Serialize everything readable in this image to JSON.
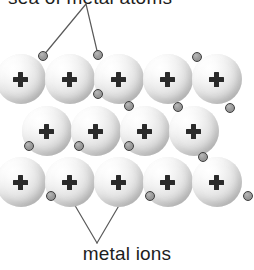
{
  "figure": {
    "background_color": "#ffffff"
  },
  "labels": {
    "top": {
      "text": "sea of metal atoms",
      "visible_fragment": "s of metal atoms",
      "clipped": "true",
      "font_size_px": 19,
      "color": "#1d1d1d"
    },
    "bottom": {
      "text": "metal ions",
      "font_size_px": 19,
      "color": "#1d1d1d"
    }
  },
  "colors": {
    "ion_highlight": "#ffffff",
    "ion_midtone": "#e4e4e4",
    "ion_shadow": "#a9a9a9",
    "electron_fill": "#9d9d9d",
    "electron_stroke": "#3c3c3c",
    "plus_sign": "#2a2a2a",
    "leader_line": "#5a5a5a"
  },
  "lattice": {
    "ion_symbol": "+",
    "ion_count": 14,
    "electron_count": 14,
    "rows": [
      {
        "name": "top-row",
        "ion_count": 5,
        "y": 54,
        "diameter": 50,
        "x_positions": [
          -4,
          45,
          94,
          143,
          192
        ]
      },
      {
        "name": "middle-row",
        "ion_count": 4,
        "y": 106,
        "diameter": 50,
        "x_positions": [
          22,
          71,
          120,
          169
        ]
      },
      {
        "name": "bottom-row",
        "ion_count": 5,
        "y": 157,
        "diameter": 50,
        "x_positions": [
          -4,
          45,
          94,
          143,
          192
        ]
      }
    ],
    "electrons": [
      {
        "x": 38,
        "y": 51
      },
      {
        "x": 93,
        "y": 50
      },
      {
        "x": 93,
        "y": 89
      },
      {
        "x": 192,
        "y": 52
      },
      {
        "x": 124,
        "y": 101
      },
      {
        "x": 173,
        "y": 102
      },
      {
        "x": 225,
        "y": 103
      },
      {
        "x": 24,
        "y": 141
      },
      {
        "x": 74,
        "y": 141
      },
      {
        "x": 124,
        "y": 141
      },
      {
        "x": 198,
        "y": 152
      },
      {
        "x": 46,
        "y": 191
      },
      {
        "x": 145,
        "y": 191
      },
      {
        "x": 243,
        "y": 191
      }
    ],
    "leaders": {
      "top": {
        "apex": {
          "x": 86,
          "y": 4
        },
        "targets": [
          {
            "x": 43,
            "y": 56
          },
          {
            "x": 98,
            "y": 55
          }
        ]
      },
      "bottom": {
        "apex": {
          "x": 97,
          "y": 243
        },
        "targets": [
          {
            "x": 70,
            "y": 197
          },
          {
            "x": 124,
            "y": 197
          }
        ]
      }
    }
  }
}
